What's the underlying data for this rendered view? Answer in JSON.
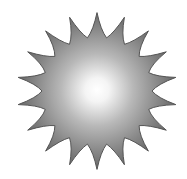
{
  "image": {
    "subject": "sun-clipart",
    "rays": 18,
    "colors": {
      "background": "#ffffff",
      "center": "#ffffff",
      "mid": "#b4b4b4",
      "edge": "#666666",
      "outline": "#555555"
    }
  }
}
